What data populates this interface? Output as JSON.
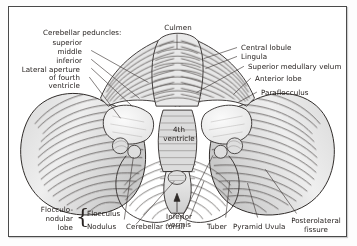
{
  "figure": {
    "background": "#ffffff",
    "frame_color": "#4a4a4a",
    "text_color": "#26211f",
    "leader_color": "#3f3a38"
  },
  "labels": {
    "cerebellar_peduncles_heading": "Cerebellar peduncles:",
    "superior": "superior",
    "middle": "middle",
    "inferior": "inferior",
    "lateral_aperture_l1": "Lateral aperture",
    "lateral_aperture_l2": "of fourth",
    "lateral_aperture_l3": "ventricle",
    "culmen": "Culmen",
    "central_lobule": "Central lobule",
    "lingula": "Lingula",
    "superior_medullary_velum": "Superior medullary velum",
    "anterior_lobe": "Anterior lobe",
    "paraflocculus": "Paraflocculus",
    "fourth_ventricle_l1": "4th",
    "fourth_ventricle_l2": "ventricle",
    "flocculonodular_l1": "Flocculo-",
    "flocculonodular_l2": "nodular",
    "flocculonodular_l3": "lobe",
    "flocculus": "Flocculus",
    "nodulus": "Nodulus",
    "cerebellar_tonsil": "Cerebellar tonsil",
    "inferior_vermis_l1": "Inferior",
    "inferior_vermis_l2": "vermis",
    "tuber": "Tuber",
    "pyramid": "Pyramid",
    "uvula": "Uvula",
    "posterolateral_l1": "Posterolateral",
    "posterolateral_l2": "fissure",
    "brace_left": "{",
    "brace_glyph": "{"
  }
}
